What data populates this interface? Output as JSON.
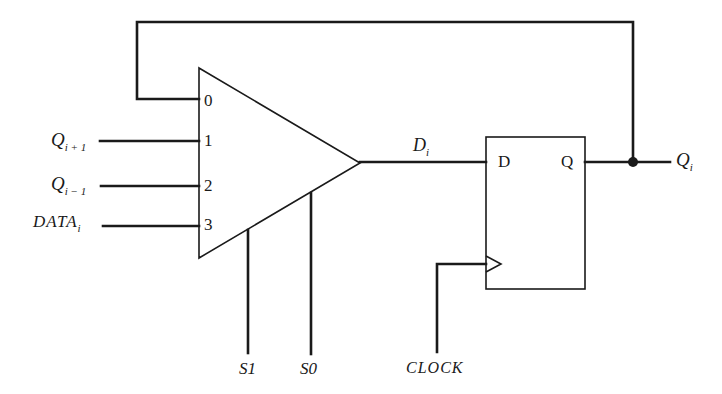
{
  "diagram": {
    "type": "shift-register-cell",
    "mux": {
      "inputs": [
        {
          "index": "0",
          "source": "feedback Q_i"
        },
        {
          "index": "1",
          "label": "Q",
          "subscript": "i + 1"
        },
        {
          "index": "2",
          "label": "Q",
          "subscript": "i − 1"
        },
        {
          "index": "3",
          "label": "DATA",
          "subscript": "i"
        }
      ],
      "selects": [
        "S1",
        "S0"
      ],
      "output": {
        "label": "D",
        "subscript": "i"
      }
    },
    "flipflop": {
      "d_label": "D",
      "q_label": "Q",
      "clock_label": "CLOCK"
    },
    "output": {
      "label": "Q",
      "subscript": "i"
    }
  }
}
